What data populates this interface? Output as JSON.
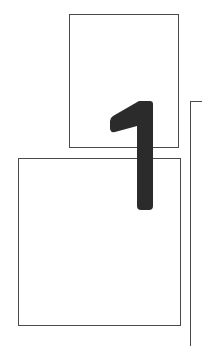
{
  "diagram": {
    "numeral": "1",
    "colors": {
      "border": "#4a4a4a",
      "numeral": "#2b2b2b",
      "background": "#ffffff"
    },
    "elements": [
      {
        "id": "box-top",
        "description": "upper page frame"
      },
      {
        "id": "box-bottom",
        "description": "lower page frame"
      },
      {
        "id": "bracket",
        "description": "right-side bracket line"
      },
      {
        "id": "numeral",
        "description": "large numeral overlapping both frames"
      }
    ]
  }
}
